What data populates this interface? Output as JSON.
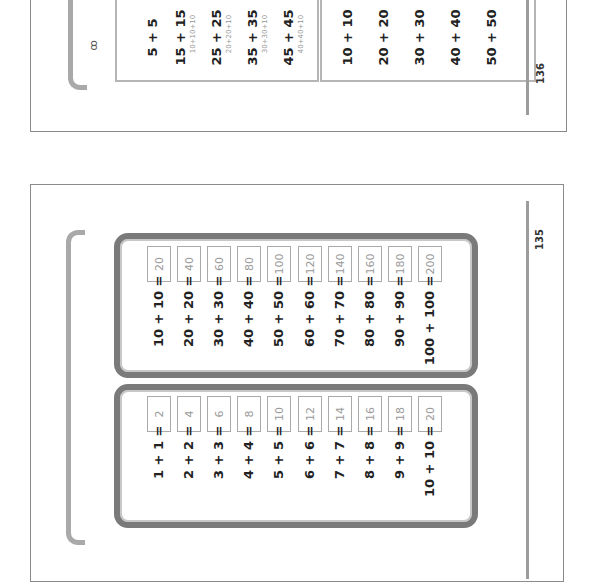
{
  "top_page": {
    "page_number": "136",
    "icon_label": "ꝏ",
    "left_box_rows": [
      {
        "expr": "5 + 5",
        "hint": ""
      },
      {
        "expr": "15 + 15",
        "hint": "10+10+10"
      },
      {
        "expr": "25 + 25",
        "hint": "20+20+10"
      },
      {
        "expr": "35 + 35",
        "hint": "30+30+10"
      },
      {
        "expr": "45 + 45",
        "hint": "40+40+10"
      }
    ],
    "right_box_rows": [
      {
        "expr": "10 + 10"
      },
      {
        "expr": "20 + 20"
      },
      {
        "expr": "30 + 30"
      },
      {
        "expr": "40 + 40"
      },
      {
        "expr": "50 + 50"
      }
    ]
  },
  "bottom_page": {
    "page_number": "135",
    "tens_box": {
      "rows": [
        {
          "expr": "10 + 10 =",
          "answer": "20"
        },
        {
          "expr": "20 + 20 =",
          "answer": "40"
        },
        {
          "expr": "30 + 30 =",
          "answer": "60"
        },
        {
          "expr": "40 + 40 =",
          "answer": "80"
        },
        {
          "expr": "50 + 50 =",
          "answer": "100"
        },
        {
          "expr": "60 + 60 =",
          "answer": "120"
        },
        {
          "expr": "70 + 70 =",
          "answer": "140"
        },
        {
          "expr": "80 + 80 =",
          "answer": "160"
        },
        {
          "expr": "90 + 90 =",
          "answer": "180"
        },
        {
          "expr": "100 + 100 =",
          "answer": "200"
        }
      ]
    },
    "ones_box": {
      "rows": [
        {
          "expr": "1 + 1 =",
          "answer": "2"
        },
        {
          "expr": "2 + 2 =",
          "answer": "4"
        },
        {
          "expr": "3 + 3 =",
          "answer": "6"
        },
        {
          "expr": "4 + 4 =",
          "answer": "8"
        },
        {
          "expr": "5 + 5 =",
          "answer": "10"
        },
        {
          "expr": "6 + 6 =",
          "answer": "12"
        },
        {
          "expr": "7 + 7 =",
          "answer": "14"
        },
        {
          "expr": "8 + 8 =",
          "answer": "16"
        },
        {
          "expr": "9 + 9 =",
          "answer": "18"
        },
        {
          "expr": "10 + 10 =",
          "answer": "20"
        }
      ]
    }
  },
  "colors": {
    "page_border": "#8a8a8a",
    "box_border": "#7a7a7a",
    "bracket": "#a9a9a9",
    "answer_text": "#9a9a9a"
  }
}
